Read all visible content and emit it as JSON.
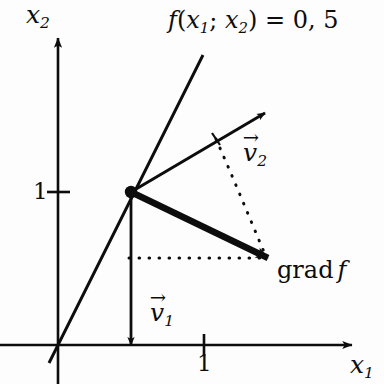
{
  "figure": {
    "ink_color": "#0d0d0d",
    "background_color": "#fdfdfd"
  },
  "axes": {
    "x_axis": {
      "name": "x-axis",
      "label_base": "x",
      "label_sub": "1",
      "tick_value": "1"
    },
    "y_axis": {
      "name": "y-axis",
      "label_base": "x",
      "label_sub": "2",
      "tick_value": "1"
    }
  },
  "annotations": {
    "function_label": {
      "f": "f",
      "open": "(",
      "arg1_base": "x",
      "arg1_sub": "1",
      "separator": ";",
      "arg2_base": "x",
      "arg2_sub": "2",
      "close": ")",
      "equals": "=",
      "value": "0, 5"
    },
    "vector_v1": {
      "accent": "→",
      "base": "v",
      "sub": "1"
    },
    "vector_v2": {
      "accent": "→",
      "base": "v",
      "sub": "2"
    },
    "gradient_label": {
      "operator": "grad",
      "function": "f"
    }
  },
  "geometry": {
    "origin": {
      "x": 58,
      "y": 345
    },
    "vertex": {
      "x": 131,
      "y": 192
    },
    "line_end": {
      "x": 203,
      "y": 55
    },
    "v2_tip": {
      "x": 265,
      "y": 113
    },
    "grad_tip": {
      "x": 268,
      "y": 258
    },
    "v1_tip": {
      "x": 131,
      "y": 345
    }
  }
}
